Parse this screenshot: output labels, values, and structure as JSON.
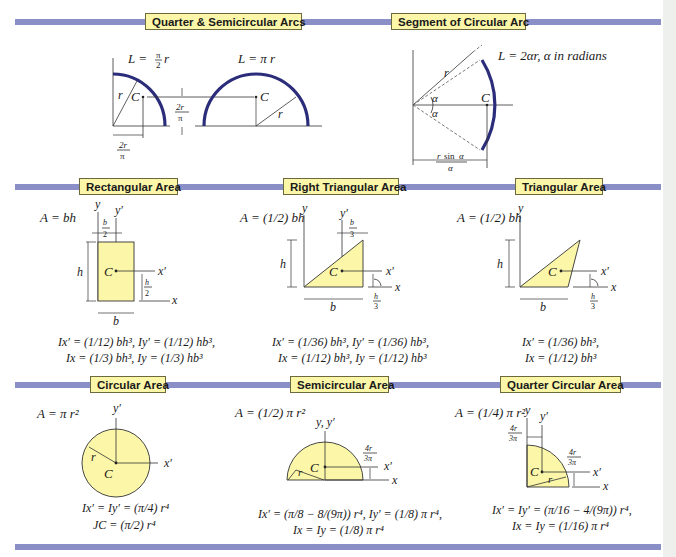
{
  "colors": {
    "band": "#8a8fc8",
    "label_bg": "#fbf6a8",
    "arc": "#2b2d7a",
    "area_fill": "#fbf6a8"
  },
  "sections": {
    "quarter_semicircular_arcs": {
      "title": "Quarter & Semicircular Arcs",
      "quarter_formula": "L = (π/2) r",
      "semi_formula": "L = π r",
      "labels": {
        "centroid": "C",
        "radius": "r",
        "offset": "2r/π"
      }
    },
    "segment_circular_arc": {
      "title": "Segment of Circular Arc",
      "formula": "L = 2αr,   α in radians",
      "labels": {
        "centroid": "C",
        "radius": "r",
        "angle": "α",
        "offset": "r sin α / α"
      }
    },
    "rectangular_area": {
      "title": "Rectangular Area",
      "area": "A = bh",
      "inertia_line1": "Ix′ = (1/12) bh³, Iy′ = (1/12) hb³,",
      "inertia_line2": "Ix = (1/3) bh³, Iy = (1/3) hb³",
      "labels": {
        "centroid": "C",
        "b": "b",
        "h": "h",
        "b_half": "b/2",
        "h_half": "h/2",
        "x": "x",
        "y": "y",
        "xp": "x′",
        "yp": "y′"
      }
    },
    "right_triangular_area": {
      "title": "Right Triangular Area",
      "area": "A = (1/2) bh",
      "inertia_line1": "Ix′ = (1/36) bh³, Iy′ = (1/36) hb³,",
      "inertia_line2": "Ix = (1/12) bh³, Iy = (1/12) hb³",
      "labels": {
        "centroid": "C",
        "b": "b",
        "h": "h",
        "b_third": "b/3",
        "h_third": "h/3",
        "x": "x",
        "y": "y",
        "xp": "x′",
        "yp": "y′"
      }
    },
    "triangular_area": {
      "title": "Triangular Area",
      "area": "A = (1/2) bh",
      "inertia_line1": "Ix′ = (1/36) bh³,",
      "inertia_line2": "Ix = (1/12) bh³",
      "labels": {
        "centroid": "C",
        "b": "b",
        "h": "h",
        "h_third": "h/3",
        "x": "x",
        "y": "y",
        "xp": "x′"
      }
    },
    "circular_area": {
      "title": "Circular Area",
      "area": "A = π r²",
      "inertia_line1": "Ix′ = Iy′ = (π/4) r⁴",
      "inertia_line2": "JC = (π/2) r⁴",
      "labels": {
        "centroid": "C",
        "radius": "r",
        "xp": "x′",
        "yp": "y′"
      }
    },
    "semicircular_area": {
      "title": "Semicircular Area",
      "area": "A = (1/2) π r²",
      "inertia_line1": "Ix′ = (π/8 − 8/(9π)) r⁴, Iy′ = (1/8) π r⁴,",
      "inertia_line2": "Ix = Iy = (1/8) π r⁴",
      "labels": {
        "centroid": "C",
        "radius": "r",
        "offset": "4r/3π",
        "yyp": "y, y′",
        "x": "x",
        "xp": "x′"
      }
    },
    "quarter_circular_area": {
      "title": "Quarter Circular Area",
      "area": "A = (1/4) π r²",
      "inertia_line1": "Ix′ = Iy′ = (π/16 − 4/(9π)) r⁴,",
      "inertia_line2": "Ix = Iy = (1/16) π r⁴",
      "labels": {
        "centroid": "C",
        "radius": "r",
        "offset": "4r/3π",
        "x": "x",
        "y": "y",
        "xp": "x′",
        "yp": "y′"
      }
    }
  }
}
